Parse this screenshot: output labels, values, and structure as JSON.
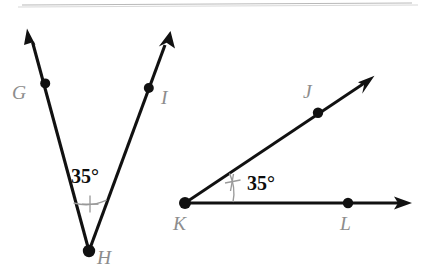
{
  "figure": {
    "background_color": "#ffffff",
    "stroke_color": "#111111",
    "label_color": "#8d8d8d",
    "angle_mark_color": "#9a9a9a",
    "top_rule_color": "#b9b9b9"
  },
  "angles": [
    {
      "id": "angle-ghi",
      "name": "angle-GHI",
      "vertex_label": "H",
      "measure_text": "35°",
      "measure_value": 35,
      "tick_marks": 1,
      "rays": [
        {
          "name": "ray-hg",
          "through_label": "G"
        },
        {
          "name": "ray-hi",
          "through_label": "I"
        }
      ]
    },
    {
      "id": "angle-jkl",
      "name": "angle-JKL",
      "vertex_label": "K",
      "measure_text": "35°",
      "measure_value": 35,
      "tick_marks": 1,
      "rays": [
        {
          "name": "ray-kj",
          "through_label": "J"
        },
        {
          "name": "ray-kl",
          "through_label": "L"
        }
      ]
    }
  ],
  "labels": {
    "g": "G",
    "h": "H",
    "i": "I",
    "j": "J",
    "k": "K",
    "l": "L",
    "angle_left": "35°",
    "angle_right": "35°"
  }
}
